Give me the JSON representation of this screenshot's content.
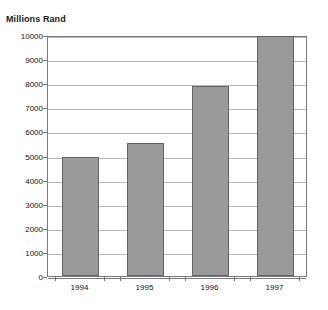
{
  "chart_data": {
    "type": "bar",
    "title": "Millions Rand",
    "xlabel": "",
    "ylabel": "",
    "categories": [
      "1994",
      "1995",
      "1996",
      "1997"
    ],
    "values": [
      4950,
      5500,
      7870,
      9970
    ],
    "ylim": [
      0,
      10000
    ],
    "ytick_step": 1000,
    "yticks": [
      "0",
      "1000",
      "2000",
      "3000",
      "4000",
      "5000",
      "6000",
      "7000",
      "8000",
      "9000",
      "10000"
    ],
    "ytick_values": [
      0,
      1000,
      2000,
      3000,
      4000,
      5000,
      6000,
      7000,
      8000,
      9000,
      10000
    ],
    "grid": true,
    "legend": false,
    "series": [
      {
        "name": "Millions Rand",
        "values": [
          4950,
          5500,
          7870,
          9970
        ],
        "bar_color": "#9a9a9a",
        "bar_border_color": "#636363"
      }
    ]
  },
  "colors": {
    "background": "#ffffff",
    "frame": "#7a7a7a",
    "gridline": "#b8b8b8",
    "bar_fill": "#9a9a9a",
    "bar_stroke": "#636363",
    "text": "#111111"
  }
}
